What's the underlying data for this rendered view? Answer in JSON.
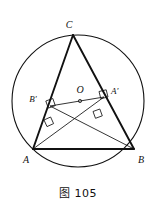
{
  "figure": {
    "caption": "图 105",
    "labels": {
      "C": "C",
      "A": "A",
      "B": "B",
      "O": "O",
      "A_prime": "A′",
      "B_prime": "B′"
    },
    "colors": {
      "ink": "#111111",
      "background": "#ffffff"
    },
    "geometry": {
      "circle": {
        "cx": 78,
        "cy": 101,
        "r": 66
      },
      "points": {
        "C": {
          "x": 73,
          "y": 35
        },
        "A": {
          "x": 33,
          "y": 149
        },
        "B": {
          "x": 134,
          "y": 149
        },
        "O": {
          "x": 80,
          "y": 101
        },
        "A_prime": {
          "x": 104,
          "y": 97
        },
        "B_prime": {
          "x": 50,
          "y": 106
        }
      },
      "segments": [
        {
          "name": "CA",
          "from": "C",
          "to": "A",
          "weight": "heavy"
        },
        {
          "name": "CB",
          "from": "C",
          "to": "B",
          "weight": "heavy"
        },
        {
          "name": "AB",
          "from": "A",
          "to": "B",
          "weight": "heavy"
        },
        {
          "name": "AA-prime",
          "from": "A",
          "to": "A_prime",
          "weight": "light"
        },
        {
          "name": "BB-prime",
          "from": "B",
          "to": "B_prime",
          "weight": "light"
        },
        {
          "name": "OA-prime",
          "from": "O",
          "to": "A_prime",
          "weight": "light"
        },
        {
          "name": "OB-prime",
          "from": "O",
          "to": "B_prime",
          "weight": "light"
        }
      ],
      "right_angle_marks": [
        {
          "name": "right-angle-at-B-prime-on-CA",
          "x": 50,
          "y": 106
        },
        {
          "name": "right-angle-at-A-prime-on-CB",
          "x": 104,
          "y": 97
        },
        {
          "name": "right-angle-on-AA-prime",
          "x": 97,
          "y": 116
        },
        {
          "name": "right-angle-on-BB-prime",
          "x": 49,
          "y": 124
        }
      ]
    }
  }
}
